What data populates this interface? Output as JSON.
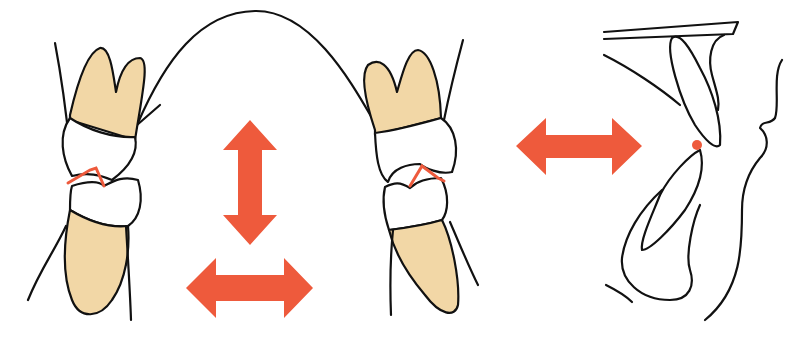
{
  "figure": {
    "description": "Dental occlusion diagram: two side-view tooth pairs with red occlusal contact lines, vertical and horizontal movement arrows, and a sagittal profile view of incisors with a red contact point",
    "colors": {
      "background": "#ffffff",
      "outline": "#111111",
      "root_fill": "#f2d7a6",
      "crown_fill": "#ffffff",
      "accent": "#ee5a3c"
    },
    "panels": [
      {
        "id": "left-tooth-pair",
        "label": "Left molar/premolar pair in occlusion"
      },
      {
        "id": "arch-curve",
        "label": "Arch curve connecting teeth"
      },
      {
        "id": "right-tooth-pair",
        "label": "Right molar/premolar pair in occlusion"
      },
      {
        "id": "profile-view",
        "label": "Sagittal profile of incisors"
      }
    ],
    "arrows": [
      {
        "id": "vertical-arrow",
        "direction": "up-down"
      },
      {
        "id": "horizontal-arrow-bottom",
        "direction": "left-right"
      },
      {
        "id": "horizontal-arrow-right",
        "direction": "left-right"
      }
    ],
    "markers": [
      {
        "id": "incisal-contact-point",
        "shape": "dot"
      }
    ]
  }
}
